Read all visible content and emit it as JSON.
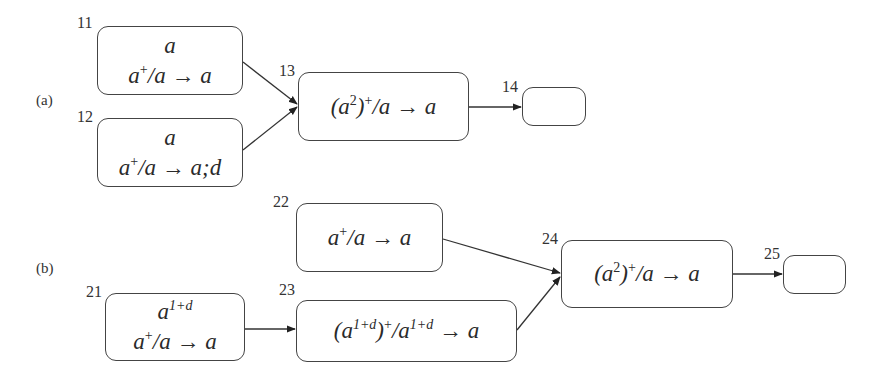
{
  "figure": {
    "parts": [
      {
        "label": "(a)",
        "nodes": [
          {
            "id": "11",
            "number": "11",
            "lines": [
              "a",
              "a⁺/a → a"
            ]
          },
          {
            "id": "12",
            "number": "12",
            "lines": [
              "a",
              "a⁺/a → a;d"
            ]
          },
          {
            "id": "13",
            "number": "13",
            "lines": [
              "(a²)⁺/a → a"
            ]
          },
          {
            "id": "14",
            "number": "14",
            "lines": []
          }
        ],
        "edges": [
          [
            "11",
            "13"
          ],
          [
            "12",
            "13"
          ],
          [
            "13",
            "14"
          ]
        ]
      },
      {
        "label": "(b)",
        "nodes": [
          {
            "id": "21",
            "number": "21",
            "lines": [
              "a^{1+d}",
              "a⁺/a → a"
            ]
          },
          {
            "id": "22",
            "number": "22",
            "lines": [
              "a⁺/a → a"
            ]
          },
          {
            "id": "23",
            "number": "23",
            "lines": [
              "(a^{1+d})⁺/a^{1+d} → a"
            ]
          },
          {
            "id": "24",
            "number": "24",
            "lines": [
              "(a²)⁺/a → a"
            ]
          },
          {
            "id": "25",
            "number": "25",
            "lines": []
          }
        ],
        "edges": [
          [
            "21",
            "23"
          ],
          [
            "22",
            "24"
          ],
          [
            "23",
            "24"
          ],
          [
            "24",
            "25"
          ]
        ]
      }
    ],
    "text": {
      "a_label": "(a)",
      "b_label": "(b)",
      "n11": "11",
      "n12": "12",
      "n13": "13",
      "n14": "14",
      "n21": "21",
      "n22": "22",
      "n23": "23",
      "n24": "24",
      "n25": "25",
      "base": "a",
      "plus": "+",
      "sq": "2",
      "exp": "1+d",
      "slash_a": "/a",
      "slash": "/",
      "arrow_a": " → a",
      "arrow_ad": " → a;d",
      "open": "(",
      "close": ")"
    },
    "colors": {
      "stroke": "#444444",
      "text": "#2a2a2a",
      "background": "#ffffff"
    }
  }
}
